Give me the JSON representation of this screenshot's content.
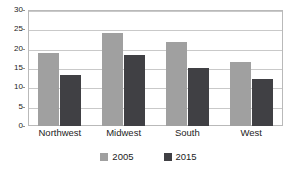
{
  "chart_data": {
    "type": "bar",
    "title": "",
    "subtitle": "",
    "xlabel": "",
    "ylabel": "",
    "categories": [
      "Northwest",
      "Midwest",
      "South",
      "West"
    ],
    "series": [
      {
        "name": "2005",
        "color": "#a0a0a0",
        "values": [
          19.0,
          24.1,
          21.6,
          16.6
        ]
      },
      {
        "name": "2015",
        "color": "#404044",
        "values": [
          13.3,
          18.4,
          15.0,
          12.2
        ]
      }
    ],
    "ylim": [
      0,
      30
    ],
    "ytick_values": [
      0,
      5,
      10,
      15,
      20,
      25,
      30
    ],
    "ytick_labels": [
      "0",
      "5",
      "10",
      "15",
      "20",
      "25",
      "30"
    ],
    "grid": true,
    "grid_axis": "y",
    "legend_position": "bottom-center",
    "plot_background": "#ffffff",
    "border_color": "#b9b9b9",
    "gridline_color": "#c9c9c9",
    "text_color": "#1d1d1d"
  }
}
